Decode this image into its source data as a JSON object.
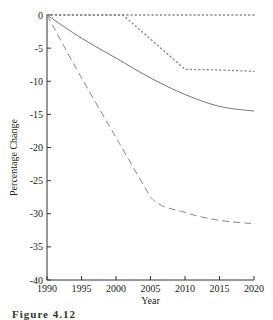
{
  "chart_data": {
    "type": "line",
    "title": "",
    "xlabel": "Year",
    "ylabel": "Percentage Change",
    "xlim": [
      1990,
      2020
    ],
    "ylim": [
      -40,
      0
    ],
    "x_ticks": [
      1990,
      1995,
      2000,
      2005,
      2010,
      2015,
      2020
    ],
    "y_ticks": [
      0,
      -5,
      -10,
      -15,
      -20,
      -25,
      -30,
      -35,
      -40
    ],
    "grid": false,
    "legend": null,
    "series": [
      {
        "name": "dotted-upper",
        "style": "dotted",
        "x": [
          1990,
          2000,
          2010,
          2020
        ],
        "values": [
          0,
          0,
          0,
          0
        ]
      },
      {
        "name": "dotted-lower",
        "style": "dotted",
        "x": [
          1990,
          2001,
          2010,
          2015,
          2020
        ],
        "values": [
          0,
          0,
          -8.2,
          -8.3,
          -8.5
        ]
      },
      {
        "name": "solid",
        "style": "solid",
        "x": [
          1990,
          1995,
          2000,
          2005,
          2010,
          2015,
          2020
        ],
        "values": [
          0,
          -3.5,
          -6.5,
          -9.5,
          -12.0,
          -13.8,
          -14.5
        ]
      },
      {
        "name": "dashed",
        "style": "dashed",
        "x": [
          1990,
          1995,
          2000,
          2005,
          2010,
          2015,
          2020
        ],
        "values": [
          0,
          -9.5,
          -18.5,
          -27.5,
          -29.8,
          -31.0,
          -31.5
        ]
      }
    ]
  },
  "caption": "Figure 4.12"
}
